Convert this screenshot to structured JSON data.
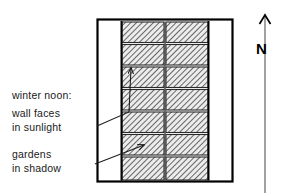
{
  "figure": {
    "type": "architectural-site-plan",
    "title_caption": "winter noon sun/shadow site plan",
    "annotations": {
      "winter_noon": "winter  noon:",
      "wall_faces": "wall faces",
      "in_sunlight": "in sunlight",
      "gardens": "gardens",
      "in_shadow": "in shadow"
    },
    "compass": {
      "label": "N",
      "icon": "north-arrow-icon",
      "direction": "up"
    },
    "colors": {
      "ink": "#000000",
      "text": "#1a1a1a",
      "hatch": "#555555",
      "hatch_fill": "#e8e8e8",
      "page": "#ffffff",
      "leader": "#333333"
    },
    "plan": {
      "outer_rect": {
        "x": 97,
        "y": 19,
        "w": 136,
        "h": 163
      },
      "courtyard_left": {
        "x": 97,
        "y": 19,
        "w": 25,
        "h": 163
      },
      "courtyard_right": {
        "x": 208,
        "y": 19,
        "w": 25,
        "h": 163
      },
      "block_columns": 2,
      "block_rows": 7,
      "hatch_band": {
        "x": 122,
        "y": 22,
        "w": 86,
        "h": 158
      },
      "center_divider_x": 165,
      "row_count_label": "7",
      "column_count_label": "2"
    },
    "leaders": [
      {
        "name": "wall-faces-in-sunlight-leader",
        "from": [
          98,
          126
        ],
        "via": [
          130,
          111
        ],
        "to": [
          131,
          66
        ],
        "arrow": true
      },
      {
        "name": "gardens-in-shadow-leader",
        "from": [
          96,
          164
        ],
        "to": [
          146,
          145
        ],
        "arrow": true
      }
    ]
  }
}
